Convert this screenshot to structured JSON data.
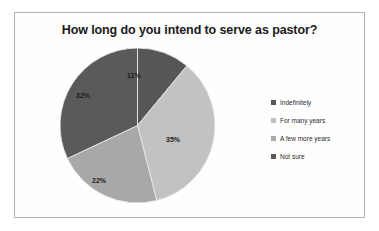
{
  "chart_data": {
    "type": "pie",
    "title": "How long do you intend to serve as pastor?",
    "categories": [
      "Indefinitely",
      "For many years",
      "A few more years",
      "Not sure"
    ],
    "values": [
      11,
      35,
      22,
      32
    ],
    "value_labels": [
      "11%",
      "35%",
      "22%",
      "32%"
    ],
    "units": "percent",
    "total": 100,
    "colors": [
      "#565656",
      "#c2c2c2",
      "#a8a8a8",
      "#5a5a5a"
    ],
    "legend_position": "right",
    "start_angle_deg": 0,
    "direction": "clockwise",
    "grid": false,
    "xlabel": "",
    "ylabel": ""
  },
  "legend": {
    "items": [
      {
        "label": "Indefinitely",
        "color": "#565656"
      },
      {
        "label": "For many years",
        "color": "#c2c2c2"
      },
      {
        "label": "A few more years",
        "color": "#a8a8a8"
      },
      {
        "label": "Not sure",
        "color": "#5a5a5a"
      }
    ]
  }
}
